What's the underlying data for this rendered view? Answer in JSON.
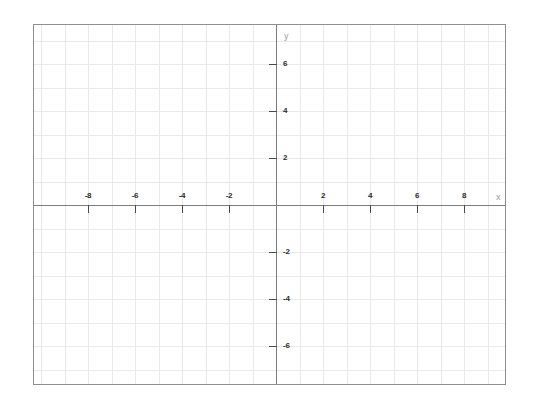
{
  "chart_data": {
    "type": "scatter",
    "title": "",
    "subtitle": "",
    "xlabel": "x",
    "ylabel": "y",
    "xlim": [
      -10.3,
      9.8
    ],
    "ylim": [
      -7.7,
      7.7
    ],
    "x_ticks": [
      -8,
      -6,
      -4,
      -2,
      2,
      4,
      6,
      8
    ],
    "y_ticks": [
      8,
      6,
      4,
      2,
      -2,
      -4,
      -6,
      -8
    ],
    "x_tick_labels": [
      "-8",
      "-6",
      "-4",
      "-2",
      "2",
      "4",
      "6",
      "8"
    ],
    "y_tick_labels": [
      "8",
      "6",
      "4",
      "2",
      "-2",
      "-4",
      "-6",
      "-8"
    ],
    "grid": true,
    "grid_step": 1,
    "legend": "none",
    "series": [],
    "values": [],
    "annotations": []
  },
  "figure": {
    "origin_x": 275,
    "origin_y": 204,
    "unit_px": 23.5,
    "frame_left": 33,
    "frame_top": 24,
    "frame_width": 473,
    "frame_height": 361
  },
  "colors": {
    "frame_border": "#8e8e8e",
    "grid_line": "#e9e9e9",
    "axis_line": "#7d7d7d",
    "tick_mark": "#4a4a4a",
    "tick_label": "#2b2b2b",
    "axis_name": "#9a9a9a",
    "background": "#ffffff"
  },
  "axis_labels": {
    "x_name": "x",
    "y_name": "y"
  }
}
